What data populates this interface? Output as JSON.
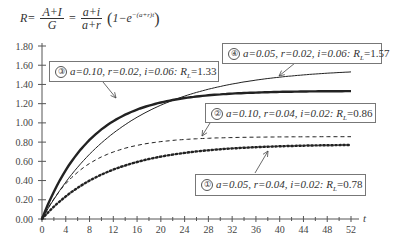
{
  "formula": {
    "lhs": "R=",
    "frac1_num": "A+I",
    "frac1_den": "G",
    "eq": "=",
    "frac2_num": "a+i",
    "frac2_den": "a+r",
    "tail": "1−e",
    "exponent": "−(a+r)t"
  },
  "chart_data": {
    "type": "line",
    "xlabel": "t",
    "ylabel": "",
    "xlim": [
      0,
      52
    ],
    "ylim": [
      0,
      1.8
    ],
    "x_ticks": [
      "0",
      "4",
      "8",
      "12",
      "16",
      "20",
      "24",
      "28",
      "32",
      "36",
      "40",
      "44",
      "48",
      "52"
    ],
    "y_ticks": [
      "0.00",
      "0.20",
      "0.40",
      "0.60",
      "0.80",
      "1.00",
      "1.20",
      "1.40",
      "1.60",
      "1.80"
    ],
    "grid": false,
    "series": [
      {
        "id": "1",
        "marker": "①",
        "name": "a=0.05, r=0.04, i=0.02: R_L=0.78",
        "a": 0.05,
        "r": 0.04,
        "i": 0.02,
        "RL": 0.78,
        "style": "dotted-thick"
      },
      {
        "id": "2",
        "marker": "②",
        "name": "a=0.10, r=0.04, i=0.02: R_L=0.86",
        "a": 0.1,
        "r": 0.04,
        "i": 0.02,
        "RL": 0.86,
        "style": "dashed"
      },
      {
        "id": "3",
        "marker": "③",
        "name": "a=0.10, r=0.02, i=0.06: R_L=1.33",
        "a": 0.1,
        "r": 0.02,
        "i": 0.06,
        "RL": 1.33,
        "style": "solid-thick"
      },
      {
        "id": "4",
        "marker": "④",
        "name": "a=0.05, r=0.02, i=0.06: R_L=1.57",
        "a": 0.05,
        "r": 0.02,
        "i": 0.06,
        "RL": 1.57,
        "style": "solid-thin"
      }
    ]
  },
  "labels": {
    "l1": {
      "marker": "①",
      "params": "a=0.05, r=0.04, i=0.02: ",
      "rl": "R",
      "sub": "L",
      "val": "=0.78"
    },
    "l2": {
      "marker": "②",
      "params": "a=0.10, r=0.04, i=0.02: ",
      "rl": "R",
      "sub": "L",
      "val": "=0.86"
    },
    "l3": {
      "marker": "③",
      "params": "a=0.10, r=0.02, i=0.06: ",
      "rl": "R",
      "sub": "L",
      "val": "=1.33"
    },
    "l4": {
      "marker": "④",
      "params": "a=0.05, r=0.02, i=0.06: ",
      "rl": "R",
      "sub": "L",
      "val": "=1.57"
    }
  },
  "colors": {
    "axis": "#555555",
    "curve": "#222222",
    "box": "#777777"
  }
}
